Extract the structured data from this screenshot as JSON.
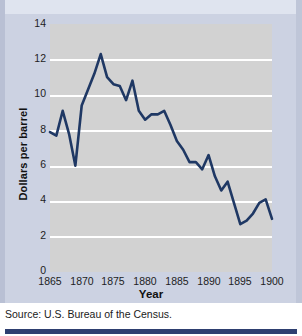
{
  "figure": {
    "source_note": "Source: U.S. Bureau of the Census.",
    "background_color": "#ccd2e2",
    "plot_background_color": "#d2d2d2",
    "gridline_color": "#ffffff",
    "series_color": "#1f3864",
    "rule_color": "#2e3f70"
  },
  "chart_data": {
    "type": "line",
    "title": "",
    "xlabel": "Year",
    "ylabel": "Dollars per barrel",
    "xlim": [
      1865,
      1900
    ],
    "ylim": [
      0,
      14
    ],
    "xticks": [
      1865,
      1870,
      1875,
      1880,
      1885,
      1890,
      1895,
      1900
    ],
    "xtick_labels": [
      "1865",
      "1870",
      "1875",
      "1880",
      "1885",
      "1890",
      "1895",
      "1900"
    ],
    "yticks": [
      0,
      2,
      4,
      6,
      8,
      10,
      12,
      14
    ],
    "ytick_labels": [
      "0",
      "2",
      "4",
      "6",
      "8",
      "10",
      "12",
      "14"
    ],
    "grid": "horizontal",
    "legend": "none",
    "series": [
      {
        "name": "Dollars per barrel",
        "color": "#1f3864",
        "x": [
          1865,
          1866,
          1867,
          1868,
          1869,
          1870,
          1871,
          1872,
          1873,
          1874,
          1875,
          1876,
          1877,
          1878,
          1879,
          1880,
          1881,
          1882,
          1883,
          1884,
          1885,
          1886,
          1887,
          1888,
          1889,
          1890,
          1891,
          1892,
          1893,
          1894,
          1895,
          1896,
          1897,
          1898,
          1899,
          1900
        ],
        "values": [
          7.9,
          7.7,
          9.1,
          7.8,
          6.0,
          9.4,
          10.3,
          11.2,
          12.3,
          11.0,
          10.6,
          10.5,
          9.7,
          10.8,
          9.1,
          8.6,
          8.9,
          8.9,
          9.1,
          8.3,
          7.4,
          6.9,
          6.2,
          6.2,
          5.8,
          6.6,
          5.4,
          4.6,
          5.1,
          3.9,
          2.7,
          2.9,
          3.3,
          3.9,
          4.1,
          3.0
        ]
      }
    ]
  }
}
